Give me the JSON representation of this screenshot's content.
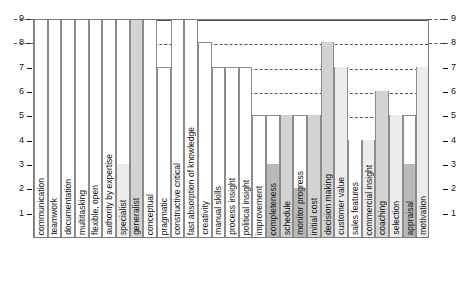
{
  "chart_data": {
    "type": "bar",
    "title": "",
    "subtitle": "",
    "xlabel": "",
    "ylabel": "",
    "ylim": [
      0,
      9
    ],
    "yticks": [
      1,
      2,
      3,
      4,
      5,
      6,
      7,
      8,
      9
    ],
    "grid": true,
    "grid_style": "dashed-horizontal",
    "legend": "none",
    "axis_left_ticks": [
      "9",
      "8",
      "7",
      "6",
      "5",
      "4",
      "3",
      "2",
      "1"
    ],
    "axis_right_ticks": [
      "9",
      "8",
      "7",
      "6",
      "5",
      "4",
      "3",
      "2",
      "1"
    ],
    "categories": [
      "communication",
      "teamwork",
      "documentation",
      "multitasking",
      "flexible, open",
      "authority by expertise",
      "specialist",
      "generalist",
      "conceptual",
      "pragmatic",
      "constructive critical",
      "fast absorption of knowledge",
      "creativity",
      "manual skills",
      "process insight",
      "political insight",
      "improvement",
      "completeness",
      "schedule",
      "monitor progress",
      "initial cost",
      "decision making",
      "customer value",
      "sales features",
      "commercial insight",
      "coaching",
      "selection",
      "appraisal",
      "motivation"
    ],
    "values": [
      9,
      9,
      9,
      9,
      9,
      9,
      9,
      9,
      9,
      7,
      9,
      9,
      8,
      7,
      7,
      7,
      5,
      5,
      5,
      5,
      5,
      8,
      7,
      4,
      4,
      6,
      5,
      5,
      7
    ],
    "base_values": [
      0,
      0,
      0,
      0,
      0,
      0,
      3,
      9,
      0,
      0,
      0,
      0,
      0,
      0,
      0,
      0,
      0,
      3,
      5,
      2,
      5,
      8,
      7,
      4,
      4,
      6,
      5,
      3,
      7
    ],
    "fills": [
      "light",
      "white",
      "light",
      "white",
      "light",
      "light",
      "light",
      "medium",
      "light",
      "light",
      "light",
      "light",
      "white",
      "light",
      "light",
      "light",
      "white",
      "dark",
      "medium",
      "dark",
      "medium",
      "medium",
      "light",
      "white",
      "light",
      "medium",
      "light",
      "dark",
      "light"
    ]
  },
  "colors": {
    "fill_light": "#ececec",
    "fill_medium": "#d3d3d3",
    "fill_dark": "#b9b9b9",
    "fill_white": "#ffffff",
    "border": "#8c8c8c",
    "axis": "#7a7a7a",
    "grid": "#555555",
    "text": "#111111",
    "background": "#ffffff"
  }
}
